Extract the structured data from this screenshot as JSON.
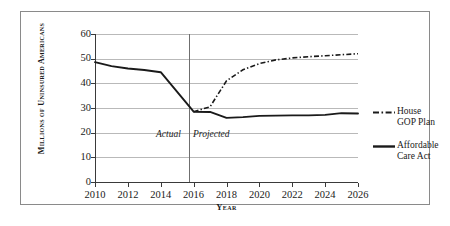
{
  "chart_data": {
    "type": "line",
    "title": "",
    "subtitle": "",
    "xlabel": "Year",
    "ylabel": "Millions of Uninsured Americans",
    "xlim": [
      2010,
      2026
    ],
    "ylim": [
      0,
      60
    ],
    "grid": true,
    "legend_position": "right",
    "xticks": [
      "2010",
      "2012",
      "2014",
      "2016",
      "2018",
      "2020",
      "2022",
      "2024",
      "2026"
    ],
    "yticks": [
      "0",
      "10",
      "20",
      "30",
      "40",
      "50",
      "60"
    ],
    "x": [
      2010,
      2011,
      2012,
      2013,
      2014,
      2015,
      2016,
      2017,
      2018,
      2019,
      2020,
      2021,
      2022,
      2023,
      2024,
      2025,
      2026
    ],
    "series": [
      {
        "name": "House GOP Plan",
        "style": "dash-dot",
        "color": "#1a1a1a",
        "x": [
          2016,
          2017,
          2018,
          2019,
          2020,
          2021,
          2022,
          2023,
          2024,
          2025,
          2026
        ],
        "values": [
          28.5,
          30.5,
          41,
          45.5,
          48,
          49.5,
          50.3,
          50.8,
          51.2,
          51.6,
          52
        ]
      },
      {
        "name": "Affordable Care Act",
        "style": "solid",
        "color": "#1a1a1a",
        "x": [
          2010,
          2011,
          2012,
          2013,
          2014,
          2015,
          2016,
          2017,
          2018,
          2019,
          2020,
          2021,
          2022,
          2023,
          2024,
          2025,
          2026
        ],
        "values": [
          48.6,
          47,
          46,
          45.4,
          44.5,
          36.5,
          28.5,
          28.4,
          26,
          26.3,
          26.8,
          26.9,
          27,
          27,
          27.2,
          27.9,
          27.8
        ]
      }
    ],
    "annotations": [
      {
        "text": "Actual",
        "x": 2014.1,
        "y": 10.5,
        "style": "italic"
      },
      {
        "text": "Projected",
        "x": 2016.1,
        "y": 10.5,
        "style": "italic"
      }
    ],
    "divider": {
      "x": 2015.7,
      "label": "actual-projected-divider"
    }
  },
  "legend": {
    "items": [
      {
        "label_line1": "House",
        "label_line2": "GOP Plan",
        "style": "dash-dot"
      },
      {
        "label_line1": "Affordable",
        "label_line2": "Care Act",
        "style": "solid"
      }
    ]
  }
}
